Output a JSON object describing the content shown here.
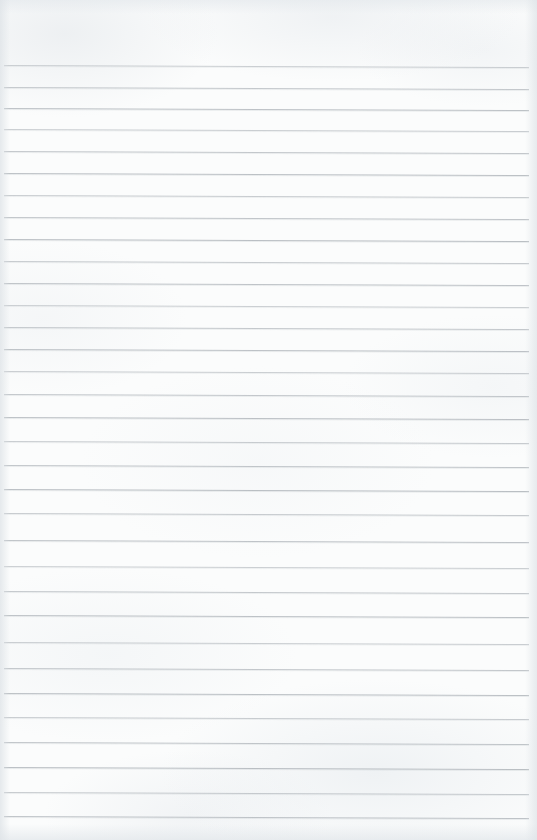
{
  "document": {
    "type": "scanned-ruled-notepad-page",
    "title": "Blank Ruled Paper Scan",
    "content_text": "",
    "handwriting_present": false,
    "page_width": 537,
    "page_height": 840
  },
  "paper": {
    "background_color": "#fbfcfc",
    "edge_shadow_color": "#dee3e7",
    "texture_description": "subtle mottled grey scan noise"
  },
  "rules": {
    "line_color": "#b7bcc1",
    "line_thickness_px": 1,
    "line_left_x": 4,
    "line_right_x": 529,
    "skew_degrees": 0.22,
    "first_line_y": 65,
    "last_line_y": 816,
    "count": 32,
    "line_y_positions": [
      65,
      87,
      108,
      129,
      151,
      173,
      195,
      217,
      239,
      261,
      283,
      305,
      327,
      349,
      371,
      394,
      417,
      441,
      465,
      489,
      513,
      540,
      566,
      591,
      615,
      642,
      668,
      693,
      717,
      742,
      767,
      792,
      816
    ]
  }
}
